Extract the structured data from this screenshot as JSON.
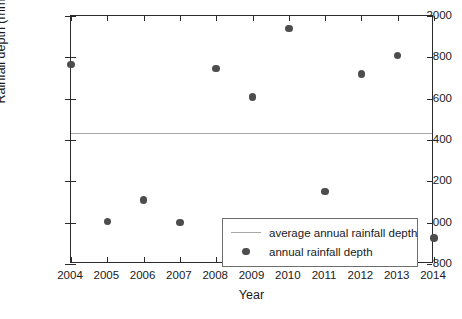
{
  "chart_data": {
    "type": "scatter",
    "title": "",
    "xlabel": "Year",
    "ylabel": "Rainfall depth (mm)",
    "xlim": [
      2004,
      2014
    ],
    "ylim": [
      800,
      2000
    ],
    "xticks": [
      2004,
      2005,
      2006,
      2007,
      2008,
      2009,
      2010,
      2011,
      2012,
      2013,
      2014
    ],
    "yticks": [
      800,
      1000,
      1200,
      1400,
      1600,
      1800,
      2000
    ],
    "xticklabels": [
      "2004",
      "2005",
      "2006",
      "2007",
      "2008",
      "2009",
      "2010",
      "2011",
      "2012",
      "2013",
      "2014"
    ],
    "yticklabels": [
      "800",
      "1000",
      "1200",
      "1400",
      "1600",
      "1800",
      "2000"
    ],
    "grid": false,
    "legend_position": "lower right",
    "series": [
      {
        "name": "average annual rainfall depth",
        "type": "hline",
        "value": 1435,
        "color": "#a8a8a8"
      },
      {
        "name": "annual rainfall depth",
        "type": "scatter",
        "color": "#4d4d4d",
        "x": [
          2004,
          2005,
          2006,
          2007,
          2008,
          2009,
          2010,
          2011,
          2012,
          2013,
          2014
        ],
        "values": [
          1765,
          1005,
          1110,
          1000,
          1745,
          1608,
          1940,
          1150,
          1720,
          1810,
          925
        ]
      }
    ]
  },
  "legend": {
    "entries": [
      {
        "label": "average annual rainfall depth",
        "marker": "line-marker"
      },
      {
        "label": "annual rainfall depth",
        "marker": "dot-marker"
      }
    ]
  },
  "colors": {
    "marker": "#4d4d4d",
    "average_line": "#a8a8a8",
    "axis": "#2b2b2b",
    "background": "#ffffff"
  }
}
